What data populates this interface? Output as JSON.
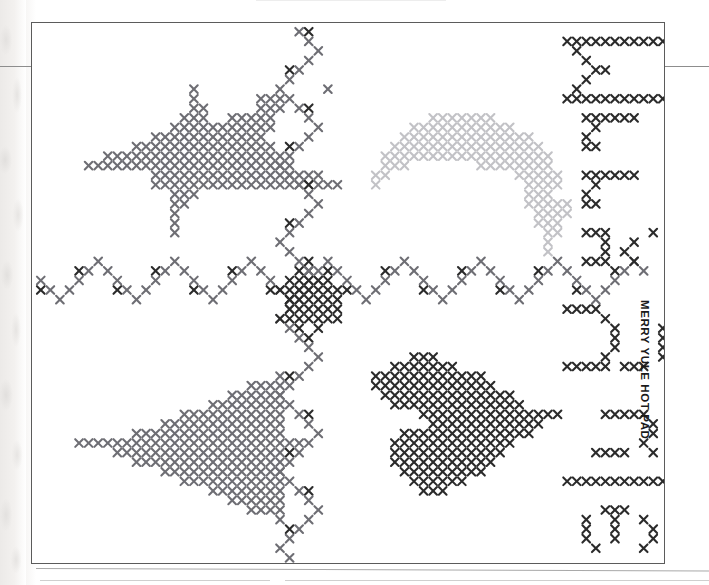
{
  "page": {
    "caption": "MERRY YULE HOT PAD",
    "background": "#ffffff",
    "frame_color": "#5b5b5b"
  },
  "palette": {
    "dark": "#2b2b2b",
    "medium": "#6e6e74",
    "light": "#c2c2c6",
    "accent_dark": "#3a3a3a"
  },
  "chart_data": {
    "type": "heatmap",
    "title": "MERRY YULE HOT PAD",
    "xlabel": "",
    "ylabel": "",
    "grid": false,
    "legend_position": "none",
    "cell_px": 9.6,
    "symbol": "x",
    "colors": {
      "dark": "#2b2b2b",
      "medium": "#6e6e74",
      "light": "#c2c2c6"
    },
    "motifs": [
      {
        "name": "reindeer",
        "color": "medium",
        "origin": [
          4,
          6
        ],
        "rows": [
          "............X.............X..",
          "............X......XXX.......",
          "............XX.....XXX.......",
          "...........XXX..XXXXX........",
          "..........XXXXXXXXXXX........",
          "........XXXXXXXXXXXX.........",
          "......XXXXXXXXXXXXXXX........",
          "...XXXXXXXXXXXXXXXXXXX.......",
          ".XXXXXXXXXXXXXXXXXXXXXX......",
          "........XXXXXXXXXXXXXXXXXX...",
          "........XXXXXXXXXXXXXXXXXXXX.",
          "..........XXX................",
          "..........XX.................",
          "..........X..................",
          "..........X..................",
          "..........X.................."
        ]
      },
      {
        "name": "candy-cane-arch",
        "color": "light",
        "origin": [
          35,
          9
        ],
        "rows": [
          "......XXXXXXX........",
          "....XXXXXXXXXXX......",
          "...XXXXXXXXXXXXXX....",
          "..XXXXXXXXXXXXXXXX...",
          ".XXXXXXXXXXXXXXXXXX..",
          ".XXX.......XXXXXXXX..",
          "XX.............XXXXX.",
          "X...............XXXX.",
          "................XXX..",
          "................XXXXX",
          ".................XXXX",
          ".................XXX.",
          "..................XX.",
          "..................X..",
          "..................X.."
        ]
      },
      {
        "name": "tree",
        "color": "medium",
        "origin": [
          4,
          36
        ],
        "rows": [
          ".....................X..",
          "..................XXXX..",
          "................XXXXXX..",
          "..............XXXXXXXX..",
          "...........XXXXXXXXXXX..",
          ".........XXXXXXXXXXXXX..",
          "......XXXXXXXXXXXXXXXX..",
          "XXXXXXXXXXXXXXXXXXXXXXXX",
          "....XXXXXXXXXXXXXXXXXX..",
          "......XXXXXXXXXXXXXXXX..",
          ".........XXXXXXXXXXXXX..",
          "...........XXXXXXXXXXX..",
          "..............XXXXXXXX..",
          "................XXXXXX..",
          "..................XXXX..",
          ".....................X.."
        ]
      },
      {
        "name": "bell",
        "color": "dark",
        "origin": [
          35,
          34
        ],
        "rows": [
          "....XXX.............",
          "..XXXXXXX...........",
          "XXXXXXXXXXXX........",
          "XXXXXXXXXXXXX.......",
          ".XXXXXXXXXXXXXX.....",
          "..XXXXXXXXXXXXXX....",
          ".....XXXXXXXXXXXXXXX",
          "......XXXXXXXXXXXX..",
          "...XXXXXXXXXXXXXX...",
          "..XXXXXXXXXXXXX.....",
          "..XXXXXXXXXXXX......",
          "..XXXXXXXXXXX.......",
          "...XXXXXXXXX........",
          "....XXXXXX..........",
          ".....XXX............"
        ]
      }
    ],
    "borders": [
      {
        "name": "horizontal-zigzag-band",
        "orientation": "horizontal",
        "row_origin": [
          0,
          26
        ],
        "colors": [
          "medium",
          "dark"
        ],
        "repeat_period": 8
      },
      {
        "name": "vertical-zigzag-band",
        "orientation": "vertical",
        "col_origin": [
          27,
          0
        ],
        "colors": [
          "medium",
          "dark"
        ],
        "repeat_period": 8
      },
      {
        "name": "center-diamond",
        "color": "dark",
        "origin": [
          25,
          25
        ]
      }
    ],
    "lettering": {
      "text": "MERRY YULE",
      "color": "dark",
      "orientation": "rotated-90",
      "glyph_blocks": [
        {
          "letter": "M",
          "origin": [
            55,
            1
          ]
        },
        {
          "letter": "E",
          "origin": [
            55,
            9
          ]
        },
        {
          "letter": "R",
          "origin": [
            55,
            15
          ]
        },
        {
          "letter": "R",
          "origin": [
            55,
            21
          ]
        },
        {
          "letter": "Y",
          "origin": [
            55,
            27
          ]
        },
        {
          "letter": "Y",
          "origin": [
            55,
            34
          ]
        },
        {
          "letter": "U",
          "origin": [
            55,
            41
          ]
        },
        {
          "letter": "L",
          "origin": [
            55,
            47
          ]
        },
        {
          "letter": "E",
          "origin": [
            55,
            52
          ]
        }
      ]
    }
  }
}
